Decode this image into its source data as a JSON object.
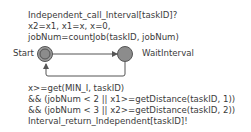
{
  "diagram": {
    "type": "timed-automaton",
    "states": [
      {
        "id": "start",
        "name": "Start",
        "initial": true
      },
      {
        "id": "waitinterval",
        "name": "WaitInterval",
        "initial": false
      }
    ],
    "transitions": [
      {
        "from": "Start",
        "to": "WaitInterval",
        "label_lines": [
          "Independent_call_Interval[taskID]?",
          "x2=x1, x1=x, x=0,",
          "jobNum=countJob(taskID, jobNum)"
        ]
      },
      {
        "from": "WaitInterval",
        "to": "Start",
        "label_lines": [
          "x>=get(MIN_I, taskID)",
          "&& (jobNum < 2 || x1>=getDistance(taskID, 1))",
          "&& (jobNum < 3 || x2>=getDistance(taskID, 2))",
          "Interval_return_Independent[taskID]!"
        ]
      }
    ],
    "colors": {
      "state_fill": "#8c8c8c",
      "state_stroke": "#555555",
      "edge": "#555555",
      "text": "#3a3a3a"
    }
  }
}
